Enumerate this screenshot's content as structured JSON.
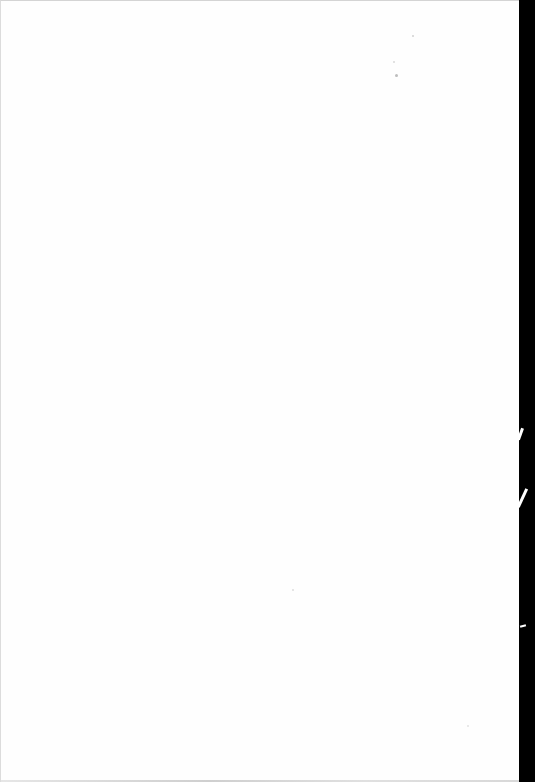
{
  "document": {
    "type": "blank scanned page",
    "text": "",
    "colors": {
      "page": "#fefefe",
      "scanner_edge": "#000000",
      "border": "#d4d4d4",
      "speck": "#bdbdbd"
    }
  }
}
